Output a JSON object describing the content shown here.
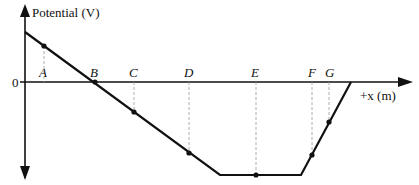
{
  "diagram": {
    "y_axis_label": "Potential (V)",
    "x_axis_label": "+x (m)",
    "zero_label": "0",
    "points": [
      {
        "label": "A",
        "x": 44,
        "y": 46
      },
      {
        "label": "B",
        "x": 95,
        "y": 82
      },
      {
        "label": "C",
        "x": 134,
        "y": 112
      },
      {
        "label": "D",
        "x": 189,
        "y": 153
      },
      {
        "label": "E",
        "x": 256,
        "y": 175
      },
      {
        "label": "F",
        "x": 312,
        "y": 155
      },
      {
        "label": "G",
        "x": 329,
        "y": 122
      }
    ],
    "colors": {
      "line": "#111111",
      "dashed": "#999999"
    }
  }
}
